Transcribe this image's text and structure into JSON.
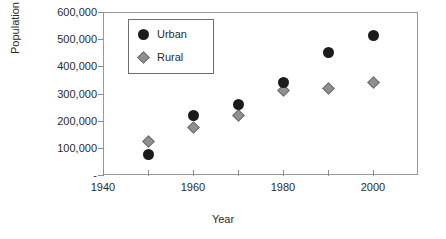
{
  "chart_data": {
    "type": "scatter",
    "title": "",
    "xlabel": "Year",
    "ylabel": "Population",
    "xlim": [
      1940,
      2010
    ],
    "ylim": [
      0,
      600000
    ],
    "grid": false,
    "legend_position": "top-left-inside",
    "x": [
      1950,
      1960,
      1970,
      1980,
      1990,
      2000
    ],
    "xticks": [
      1940,
      1960,
      1980,
      2000
    ],
    "xtick_labels": [
      "1940",
      "1960",
      "1980",
      "2000"
    ],
    "xminor_ticks": [
      1950,
      1970,
      1990
    ],
    "yticks": [
      0,
      100000,
      200000,
      300000,
      400000,
      500000,
      600000
    ],
    "ytick_labels": [
      "-",
      "100,000",
      "200,000",
      "300,000",
      "400,000",
      "500,000",
      "600,000"
    ],
    "series": [
      {
        "name": "Urban",
        "marker": "circle",
        "color": "#1c1c1c",
        "values": [
          75000,
          220000,
          258000,
          340000,
          450000,
          512000
        ]
      },
      {
        "name": "Rural",
        "marker": "diamond",
        "color": "#8f8f8f",
        "values": [
          125000,
          175000,
          220000,
          312000,
          318000,
          340000
        ]
      }
    ]
  }
}
